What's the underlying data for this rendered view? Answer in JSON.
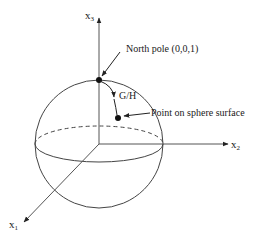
{
  "diagram": {
    "axes": {
      "x1": {
        "label": "x",
        "subscript": "1"
      },
      "x2": {
        "label": "x",
        "subscript": "2"
      },
      "x3": {
        "label": "x",
        "subscript": "3"
      }
    },
    "annotations": {
      "north_pole": "North pole (0,0,1)",
      "transform": "G/H",
      "surface_point": "Point on sphere surface"
    },
    "colors": {
      "stroke": "#333333",
      "background": "#ffffff"
    }
  }
}
